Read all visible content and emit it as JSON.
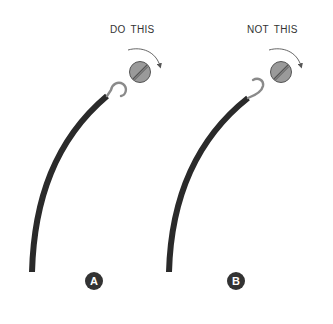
{
  "diagram": {
    "panels": [
      {
        "id": "A",
        "caption": "DO THIS",
        "badge": "A",
        "hook_direction": "clockwise (same as screw tightening)",
        "screw_rotation": "clockwise"
      },
      {
        "id": "B",
        "caption": "NOT THIS",
        "badge": "B",
        "hook_direction": "counterclockwise (opposite to screw tightening)",
        "screw_rotation": "clockwise"
      }
    ],
    "icons": {
      "screw": "slotted-screw-icon",
      "arrow": "clockwise-arrow-icon",
      "wire": "insulated-wire",
      "hook": "wire-hook"
    },
    "colors": {
      "wire": "#2a2a2a",
      "hook": "#8a8a8a",
      "screw": "#9a9a9a",
      "badge": "#333333",
      "text": "#333333"
    }
  }
}
